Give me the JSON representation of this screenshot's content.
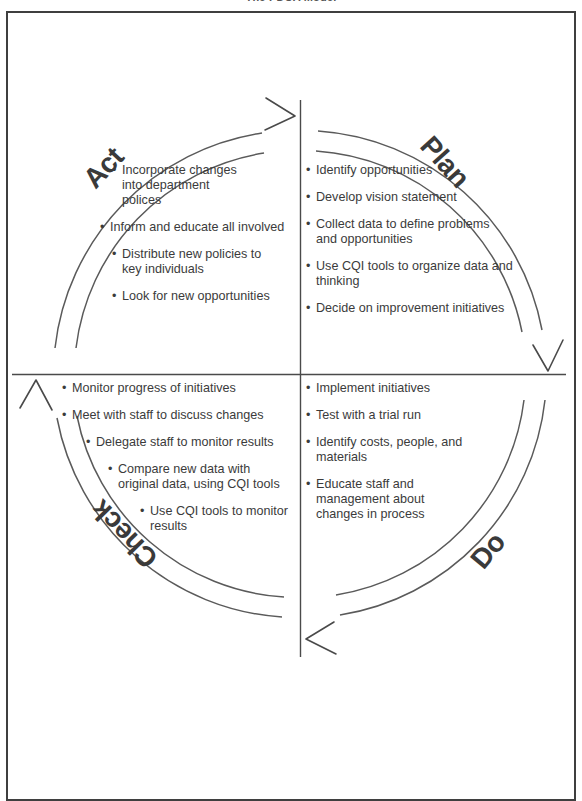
{
  "figure": {
    "title": "The PDCA Model",
    "diagram_type": "pdca-cycle",
    "colors": {
      "frame": "#3f3f3f",
      "text": "#3b3b3b",
      "stage_label": "#3a3a3a",
      "circle": "#555555",
      "background": "#ffffff"
    }
  },
  "stages": {
    "plan": {
      "label": "Plan",
      "quadrant": "top-right",
      "bullets": [
        {
          "text": "Identify opportunities",
          "indent": 0
        },
        {
          "text": "Develop vision statement",
          "indent": 0
        },
        {
          "text": "Collect data to define problems\nand opportunities",
          "indent": 0
        },
        {
          "text": "Use CQI tools to organize data and\nthinking",
          "indent": 0
        },
        {
          "text": "Decide on improvement initiatives",
          "indent": 0
        }
      ]
    },
    "do": {
      "label": "Do",
      "quadrant": "bottom-right",
      "bullets": [
        {
          "text": "Implement initiatives",
          "indent": 0
        },
        {
          "text": "Test with a trial run",
          "indent": 0
        },
        {
          "text": "Identify costs, people, and\nmaterials",
          "indent": 0
        },
        {
          "text": "Educate staff and\nmanagement about\nchanges in process",
          "indent": 0
        }
      ]
    },
    "check": {
      "label": "Check",
      "quadrant": "bottom-left",
      "bullets": [
        {
          "text": "Monitor progress of initiatives",
          "indent": 0
        },
        {
          "text": "Meet with staff to discuss changes",
          "indent": 0
        },
        {
          "text": "Delegate staff to monitor results",
          "indent": 2
        },
        {
          "text": "Compare new data with\noriginal data, using CQI tools",
          "indent": 3
        },
        {
          "text": "Use CQI tools to monitor\nresults",
          "indent": 4
        }
      ]
    },
    "act": {
      "label": "Act",
      "quadrant": "top-left",
      "bullets": [
        {
          "text": "Incorporate changes\ninto department\npolices",
          "indent": 2
        },
        {
          "text": "Inform and educate all involved",
          "indent": 1
        },
        {
          "text": "Distribute new policies to\nkey individuals",
          "indent": 2
        },
        {
          "text": "Look for new opportunities",
          "indent": 2
        }
      ]
    }
  },
  "arrows": [
    {
      "name": "arrow-top-clockwise",
      "direction": "right",
      "position": "top"
    },
    {
      "name": "arrow-right-clockwise",
      "direction": "down",
      "position": "right"
    },
    {
      "name": "arrow-bottom-clockwise",
      "direction": "left",
      "position": "bottom"
    },
    {
      "name": "arrow-left-clockwise",
      "direction": "up",
      "position": "left"
    }
  ]
}
